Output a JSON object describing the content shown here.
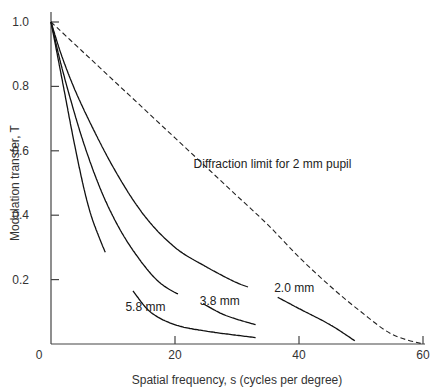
{
  "chart_data": {
    "type": "line",
    "title": "",
    "xlabel": "Spatial frequency, s (cycles per degree)",
    "ylabel": "Modulation transfer, T",
    "xlim": [
      0,
      60
    ],
    "ylim": [
      0,
      1.0
    ],
    "x_ticks": [
      0,
      20,
      40,
      60
    ],
    "y_ticks": [
      0.2,
      0.4,
      0.6,
      0.8,
      1.0
    ],
    "x_tick_labels": [
      "0",
      "20",
      "40",
      "60"
    ],
    "y_tick_labels": [
      "0.2",
      "0.4",
      "0.6",
      "0.8",
      "1.0"
    ],
    "origin_label": "0",
    "grid": false,
    "legend": "inline labels",
    "series": [
      {
        "name": "Diffraction limit for 2 mm pupil",
        "style": "dashed",
        "x": [
          0,
          5,
          10,
          15,
          20,
          25,
          30,
          35,
          40,
          45,
          50,
          55,
          60
        ],
        "y": [
          1.0,
          0.91,
          0.82,
          0.73,
          0.64,
          0.55,
          0.46,
          0.37,
          0.27,
          0.18,
          0.1,
          0.03,
          0.0
        ]
      },
      {
        "name": "2.0 mm",
        "style": "solid",
        "x": [
          0,
          2,
          5,
          10,
          15,
          20,
          25,
          30,
          33,
          36,
          40,
          45,
          49
        ],
        "y": [
          1.0,
          0.88,
          0.74,
          0.55,
          0.4,
          0.3,
          0.24,
          0.19,
          0.17,
          0.15,
          0.11,
          0.06,
          0.01
        ]
      },
      {
        "name": "3.8 mm",
        "style": "solid",
        "x": [
          0,
          2,
          5,
          8,
          11,
          14,
          17,
          20,
          24,
          28,
          33
        ],
        "y": [
          1.0,
          0.84,
          0.64,
          0.48,
          0.36,
          0.27,
          0.2,
          0.16,
          0.13,
          0.09,
          0.06
        ]
      },
      {
        "name": "5.8 mm",
        "style": "solid",
        "x": [
          0,
          2,
          4,
          6,
          8,
          10,
          13,
          16,
          20,
          25,
          33
        ],
        "y": [
          1.0,
          0.8,
          0.6,
          0.43,
          0.32,
          0.24,
          0.17,
          0.1,
          0.06,
          0.04,
          0.02
        ]
      }
    ],
    "annotations": [
      {
        "text": "Diffraction limit for 2 mm pupil",
        "x": 23,
        "y": 0.56
      },
      {
        "text": "2.0 mm",
        "x": 36,
        "y": 0.175
      },
      {
        "text": "3.8 mm",
        "x": 24,
        "y": 0.135
      },
      {
        "text": "5.8 mm",
        "x": 12,
        "y": 0.115
      }
    ]
  }
}
